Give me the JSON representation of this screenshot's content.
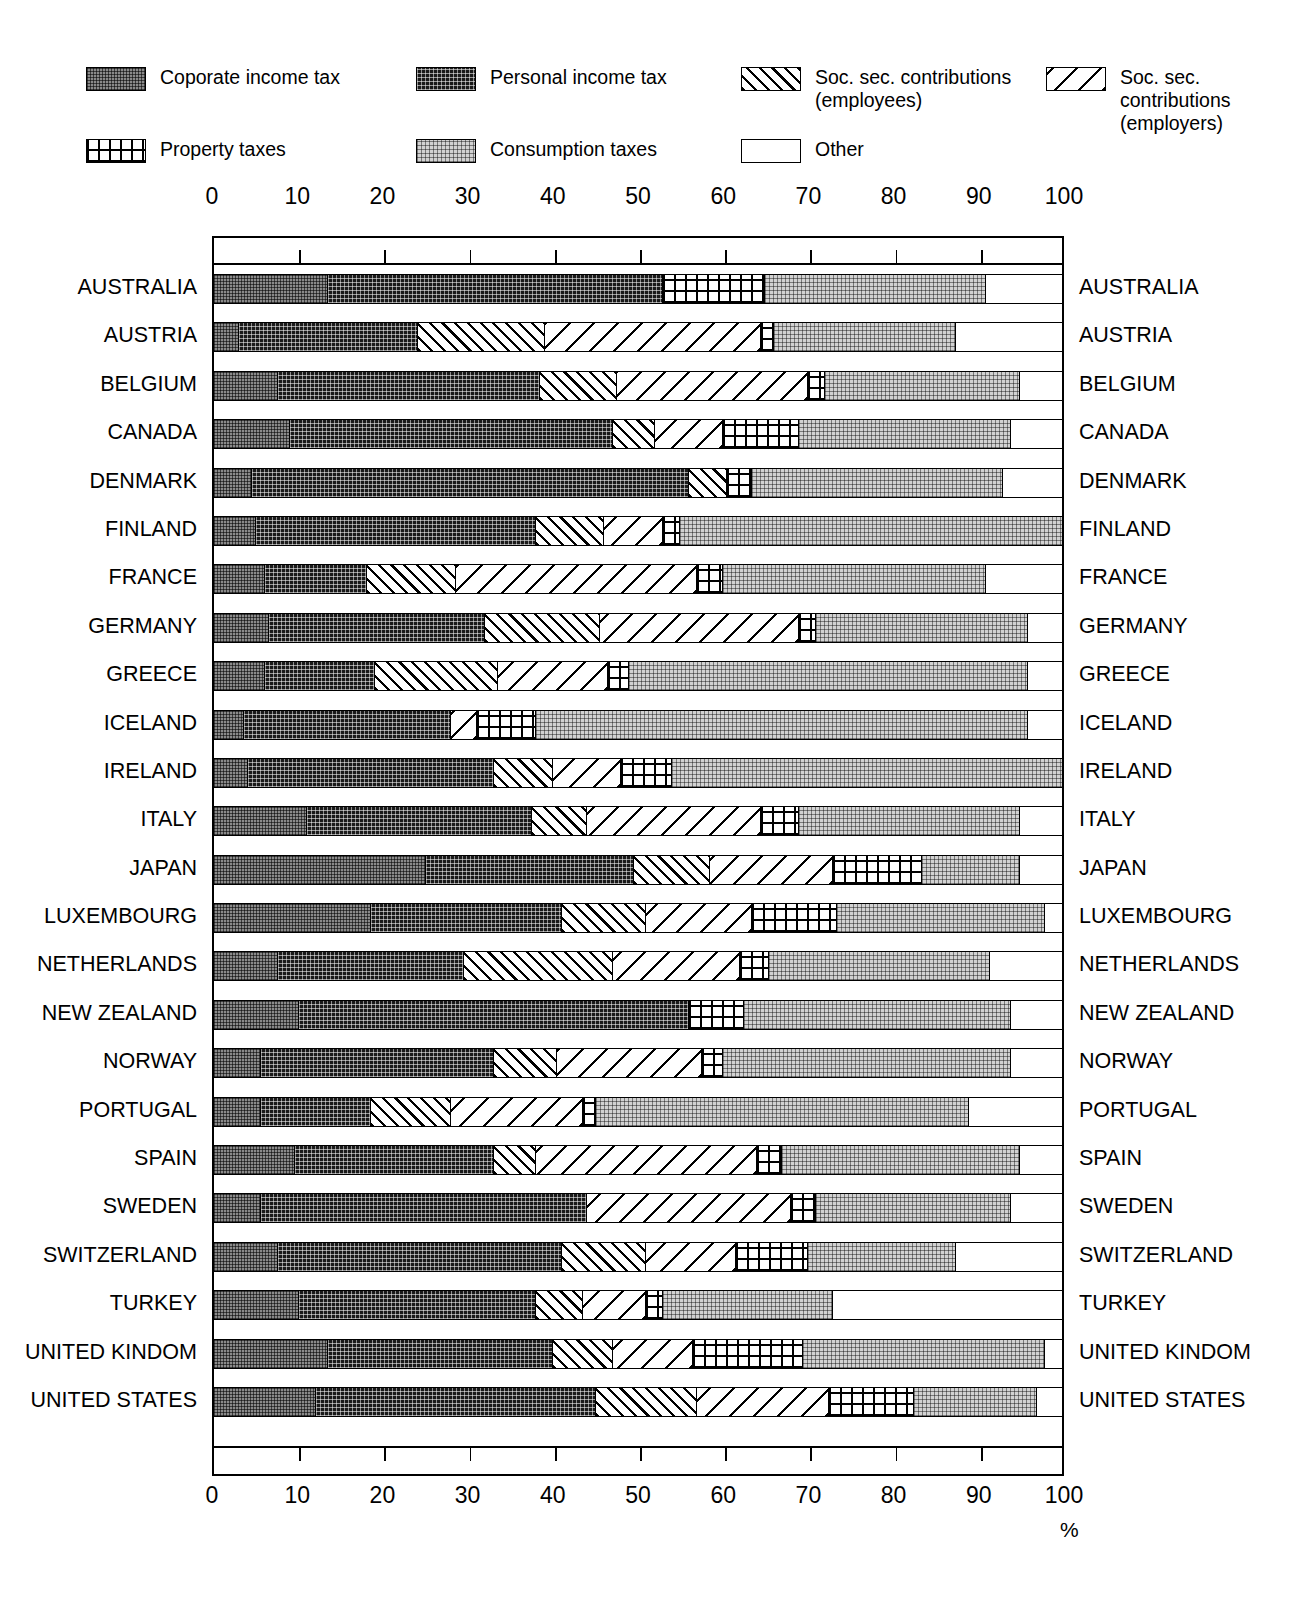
{
  "legend": {
    "rows": [
      [
        {
          "key": "corporate",
          "label": "Coporate income tax",
          "pattern": "p-corp"
        },
        {
          "key": "personal",
          "label": "Personal income tax",
          "pattern": "p-pers"
        },
        {
          "key": "ss_employees",
          "label": "Soc. sec. contributions\n(employees)",
          "pattern": "p-ssee"
        },
        {
          "key": "ss_employers",
          "label": "Soc. sec. contributions\n(employers)",
          "pattern": "p-sser"
        }
      ],
      [
        {
          "key": "property",
          "label": "Property taxes",
          "pattern": "p-prop"
        },
        {
          "key": "consumption",
          "label": "Consumption taxes",
          "pattern": "p-cons"
        },
        {
          "key": "other",
          "label": "Other",
          "pattern": "p-other"
        }
      ]
    ]
  },
  "axis": {
    "ticks": [
      0,
      10,
      20,
      30,
      40,
      50,
      60,
      70,
      80,
      90,
      100
    ],
    "unit_label": "%",
    "min": 0,
    "max": 100
  },
  "chart_data": {
    "type": "bar",
    "title": "",
    "subtitle": "",
    "xlabel": "%",
    "ylabel": "",
    "xlim": [
      0,
      100
    ],
    "grid": false,
    "stacked": true,
    "orientation": "horizontal",
    "legend_position": "top",
    "series": [
      {
        "name": "Coporate income tax",
        "key": "corporate",
        "pattern": "p-corp"
      },
      {
        "name": "Personal income tax",
        "key": "personal",
        "pattern": "p-pers"
      },
      {
        "name": "Soc. sec. contributions (employees)",
        "key": "ss_employees",
        "pattern": "p-ssee"
      },
      {
        "name": "Soc. sec. contributions (employers)",
        "key": "ss_employers",
        "pattern": "p-sser"
      },
      {
        "name": "Property taxes",
        "key": "property",
        "pattern": "p-prop"
      },
      {
        "name": "Consumption taxes",
        "key": "consumption",
        "pattern": "p-cons"
      },
      {
        "name": "Other",
        "key": "other",
        "pattern": "p-other"
      }
    ],
    "categories": [
      "AUSTRALIA",
      "AUSTRIA",
      "BELGIUM",
      "CANADA",
      "DENMARK",
      "FINLAND",
      "FRANCE",
      "GERMANY",
      "GREECE",
      "ICELAND",
      "IRELAND",
      "ITALY",
      "JAPAN",
      "LUXEMBOURG",
      "NETHERLANDS",
      "NEW ZEALAND",
      "NORWAY",
      "PORTUGAL",
      "SPAIN",
      "SWEDEN",
      "SWITZERLAND",
      "TURKEY",
      "UNITED KINDOM",
      "UNITED STATES"
    ],
    "rows": [
      {
        "category": "AUSTRALIA",
        "values": {
          "corporate": 13.5,
          "personal": 39.5,
          "ss_employees": 0,
          "ss_employers": 0,
          "property": 12.0,
          "consumption": 26.0,
          "other": 9.0
        }
      },
      {
        "category": "AUSTRIA",
        "values": {
          "corporate": 3.0,
          "personal": 21.0,
          "ss_employees": 15.0,
          "ss_employers": 25.5,
          "property": 1.5,
          "consumption": 21.5,
          "other": 12.5
        }
      },
      {
        "category": "BELGIUM",
        "values": {
          "corporate": 7.5,
          "personal": 31.0,
          "ss_employees": 9.0,
          "ss_employers": 22.5,
          "property": 2.0,
          "consumption": 23.0,
          "other": 5.0
        }
      },
      {
        "category": "CANADA",
        "values": {
          "corporate": 9.0,
          "personal": 38.0,
          "ss_employees": 5.0,
          "ss_employers": 8.0,
          "property": 9.0,
          "consumption": 25.0,
          "other": 6.0
        }
      },
      {
        "category": "DENMARK",
        "values": {
          "corporate": 4.5,
          "personal": 51.5,
          "ss_employees": 4.5,
          "ss_employers": 0,
          "property": 3.0,
          "consumption": 29.5,
          "other": 7.0
        }
      },
      {
        "category": "FINLAND",
        "values": {
          "corporate": 5.0,
          "personal": 33.0,
          "ss_employees": 8.0,
          "ss_employers": 7.0,
          "property": 2.0,
          "consumption": 45.0,
          "other": 0.0
        }
      },
      {
        "category": "FRANCE",
        "values": {
          "corporate": 6.0,
          "personal": 12.0,
          "ss_employees": 10.5,
          "ss_employers": 28.5,
          "property": 3.0,
          "consumption": 31.0,
          "other": 9.0
        }
      },
      {
        "category": "GERMANY",
        "values": {
          "corporate": 6.5,
          "personal": 25.5,
          "ss_employees": 13.5,
          "ss_employers": 23.5,
          "property": 2.0,
          "consumption": 25.0,
          "other": 4.0
        }
      },
      {
        "category": "GREECE",
        "values": {
          "corporate": 6.0,
          "personal": 13.0,
          "ss_employees": 14.5,
          "ss_employers": 13.0,
          "property": 2.5,
          "consumption": 47.0,
          "other": 4.0
        }
      },
      {
        "category": "ICELAND",
        "values": {
          "corporate": 3.5,
          "personal": 24.5,
          "ss_employees": 0,
          "ss_employers": 3.0,
          "property": 7.0,
          "consumption": 58.0,
          "other": 4.0
        }
      },
      {
        "category": "IRELAND",
        "values": {
          "corporate": 4.0,
          "personal": 29.0,
          "ss_employees": 7.0,
          "ss_employers": 8.0,
          "property": 6.0,
          "consumption": 46.0,
          "other": 0.0
        }
      },
      {
        "category": "ITALY",
        "values": {
          "corporate": 11.0,
          "personal": 26.5,
          "ss_employees": 6.5,
          "ss_employers": 20.5,
          "property": 4.5,
          "consumption": 26.0,
          "other": 5.0
        }
      },
      {
        "category": "JAPAN",
        "values": {
          "corporate": 25.0,
          "personal": 24.5,
          "ss_employees": 9.0,
          "ss_employers": 14.5,
          "property": 10.5,
          "consumption": 11.5,
          "other": 5.0
        }
      },
      {
        "category": "LUXEMBOURG",
        "values": {
          "corporate": 18.5,
          "personal": 22.5,
          "ss_employees": 10.0,
          "ss_employers": 12.5,
          "property": 10.0,
          "consumption": 24.5,
          "other": 2.0
        }
      },
      {
        "category": "NETHERLANDS",
        "values": {
          "corporate": 7.5,
          "personal": 22.0,
          "ss_employees": 17.5,
          "ss_employers": 15.0,
          "property": 3.5,
          "consumption": 26.0,
          "other": 8.5
        }
      },
      {
        "category": "NEW ZEALAND",
        "values": {
          "corporate": 10.0,
          "personal": 46.0,
          "ss_employees": 0,
          "ss_employers": 0,
          "property": 6.5,
          "consumption": 31.5,
          "other": 6.0
        }
      },
      {
        "category": "NORWAY",
        "values": {
          "corporate": 5.5,
          "personal": 27.5,
          "ss_employees": 7.5,
          "ss_employers": 17.0,
          "property": 2.5,
          "consumption": 34.0,
          "other": 6.0
        }
      },
      {
        "category": "PORTUGAL",
        "values": {
          "corporate": 5.5,
          "personal": 13.0,
          "ss_employees": 9.5,
          "ss_employers": 15.5,
          "property": 1.5,
          "consumption": 44.0,
          "other": 11.0
        }
      },
      {
        "category": "SPAIN",
        "values": {
          "corporate": 9.5,
          "personal": 23.5,
          "ss_employees": 5.0,
          "ss_employers": 26.0,
          "property": 3.0,
          "consumption": 28.0,
          "other": 5.0
        }
      },
      {
        "category": "SWEDEN",
        "values": {
          "corporate": 5.5,
          "personal": 38.5,
          "ss_employees": 0,
          "ss_employers": 24.0,
          "property": 3.0,
          "consumption": 23.0,
          "other": 6.0
        }
      },
      {
        "category": "SWITZERLAND",
        "values": {
          "corporate": 7.5,
          "personal": 33.5,
          "ss_employees": 10.0,
          "ss_employers": 10.5,
          "property": 8.5,
          "consumption": 17.5,
          "other": 12.5
        }
      },
      {
        "category": "TURKEY",
        "values": {
          "corporate": 10.0,
          "personal": 28.0,
          "ss_employees": 5.5,
          "ss_employers": 7.5,
          "property": 2.0,
          "consumption": 20.0,
          "other": 27.0
        }
      },
      {
        "category": "UNITED KINDOM",
        "values": {
          "corporate": 13.5,
          "personal": 26.5,
          "ss_employees": 7.0,
          "ss_employers": 9.5,
          "property": 13.0,
          "consumption": 28.5,
          "other": 2.0
        }
      },
      {
        "category": "UNITED STATES",
        "values": {
          "corporate": 12.0,
          "personal": 33.0,
          "ss_employees": 12.0,
          "ss_employers": 15.5,
          "property": 10.0,
          "consumption": 14.5,
          "other": 3.0
        }
      }
    ]
  }
}
